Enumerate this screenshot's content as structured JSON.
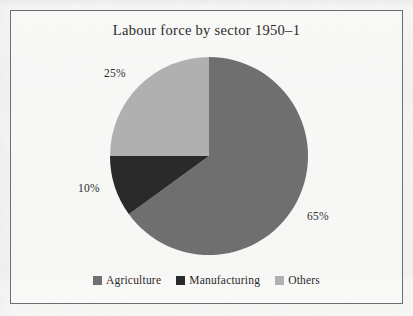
{
  "figure": {
    "title": "Labour force by sector 1950–1",
    "frame_border_color": "#6e6e72",
    "page_background": "#f8f8f7"
  },
  "labels": {
    "agriculture_pct": "65%",
    "manufacturing_pct": "10%",
    "others_pct": "25%"
  },
  "legend": {
    "items": [
      {
        "label": "Agriculture",
        "color": "#6f6f6f"
      },
      {
        "label": "Manufacturing",
        "color": "#2a2a2a"
      },
      {
        "label": "Others",
        "color": "#b0b0b0"
      }
    ]
  },
  "chart_data": {
    "type": "pie",
    "title": "Labour force by sector 1950–1",
    "xlabel": "",
    "ylabel": "",
    "grid": false,
    "legend_position": "bottom",
    "start_angle_deg": 90,
    "direction": "clockwise",
    "categories": [
      "Agriculture",
      "Manufacturing",
      "Others"
    ],
    "values": [
      65,
      10,
      25
    ],
    "value_unit": "percent",
    "data_labels": [
      "65%",
      "10%",
      "25%"
    ],
    "colors": [
      "#6f6f6f",
      "#2a2a2a",
      "#b0b0b0"
    ],
    "slices": [
      {
        "name": "Agriculture",
        "value": 65,
        "label": "65%",
        "color": "#6f6f6f",
        "start_deg": 0,
        "end_deg": 234
      },
      {
        "name": "Manufacturing",
        "value": 10,
        "label": "10%",
        "color": "#2a2a2a",
        "start_deg": 234,
        "end_deg": 270
      },
      {
        "name": "Others",
        "value": 25,
        "label": "25%",
        "color": "#b0b0b0",
        "start_deg": 270,
        "end_deg": 360
      }
    ],
    "total": 100
  }
}
